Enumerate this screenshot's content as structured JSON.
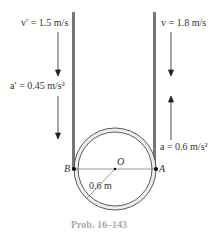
{
  "diagram": {
    "left_label_v": "v′ = 1.5 m/s",
    "left_label_a": "a′ = 0.45 m/s²",
    "right_label_v": "v = 1.8 m/s",
    "right_label_a": "a = 0.6 m/s²",
    "point_b": "B",
    "point_a": "A",
    "center": "O",
    "radius": "0.6 m",
    "caption": "Prob. 16–143",
    "colors": {
      "rope": "#777777",
      "pulley_fill": "#eeeeee",
      "line": "#333333",
      "caption": "#aaaaaa"
    }
  }
}
